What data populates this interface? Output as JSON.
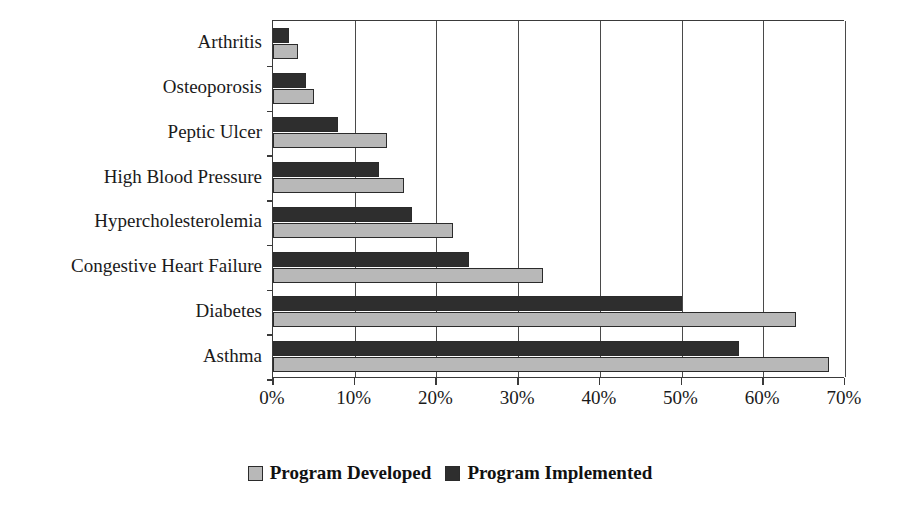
{
  "chart_data": {
    "type": "bar",
    "orientation": "horizontal",
    "title": "",
    "subtitle": "",
    "xlabel": "",
    "ylabel": "",
    "xlim": [
      0,
      70
    ],
    "xtick_values": [
      0,
      10,
      20,
      30,
      40,
      50,
      60,
      70
    ],
    "xtick_labels": [
      "0%",
      "10%",
      "20%",
      "30%",
      "40%",
      "50%",
      "60%",
      "70%"
    ],
    "grid": "vertical",
    "legend_position": "bottom-center",
    "categories": [
      "Arthritis",
      "Osteoporosis",
      "Peptic Ulcer",
      "High Blood Pressure",
      "Hypercholesterolemia",
      "Congestive Heart Failure",
      "Diabetes",
      "Asthma"
    ],
    "series": [
      {
        "name": "Program Developed",
        "color": "#b8b8b8",
        "values": [
          3,
          5,
          14,
          16,
          22,
          33,
          64,
          68
        ]
      },
      {
        "name": "Program Implemented",
        "color": "#2e2e2e",
        "values": [
          2,
          4,
          8,
          13,
          17,
          24,
          50,
          57
        ]
      }
    ]
  },
  "legend": {
    "items": [
      {
        "label": "Program Developed",
        "swatch": "developed"
      },
      {
        "label": "Program Implemented",
        "swatch": "implemented"
      }
    ]
  }
}
